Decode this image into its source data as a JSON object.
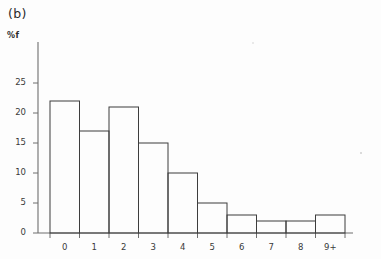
{
  "panel": {
    "label": "(b)"
  },
  "chart_data": {
    "type": "bar",
    "title": "",
    "subtitle": "",
    "xlabel": "",
    "ylabel": "%f",
    "categories": [
      "0",
      "1",
      "2",
      "3",
      "4",
      "5",
      "6",
      "7",
      "8",
      "9+"
    ],
    "values": [
      22,
      17,
      21,
      15,
      10,
      5,
      3,
      2,
      2,
      3
    ],
    "ylim": [
      0,
      27
    ],
    "yticks": [
      0,
      5,
      10,
      15,
      20,
      25
    ],
    "ytick_labels": [
      "0",
      "5",
      "10",
      "15",
      "20",
      "25"
    ],
    "xtick_labels": [
      "0",
      "1",
      "2",
      "3",
      "4",
      "5",
      "6",
      "7",
      "8",
      "9+"
    ],
    "grid": false,
    "legend": null,
    "bar_style": {
      "fill": "none",
      "edge_color": "#3d3d3d",
      "edge_width": 1
    },
    "axis_color": "#6e6e6e"
  }
}
